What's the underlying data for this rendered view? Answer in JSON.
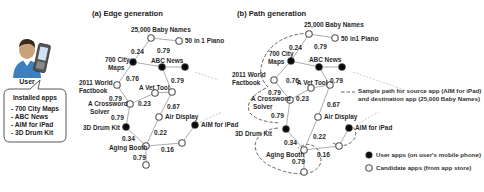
{
  "user": {
    "label": "User",
    "installed_title": "Installed apps",
    "installed_apps": [
      "- 700 City Maps",
      "- ABC News",
      "- AIM for iPad",
      "- 3D Drum Kit"
    ]
  },
  "panel_a": {
    "title": "(a) Edge generation"
  },
  "panel_b": {
    "title": "(b) Path generation"
  },
  "nodes": {
    "baby": "25,000 Baby Names",
    "piano_a": "50 in 1 Piano",
    "piano_b": "50 in1 Piano",
    "citymaps_1": "700 City",
    "citymaps_2": "Maps",
    "abc": "ABC News",
    "factbook_1": "2011 World",
    "factbook_2": "Factbook",
    "vet": "A Vet Tool",
    "crossword_1": "A Crossword",
    "crossword_2": "Solver",
    "air": "Air Display",
    "aim": "AIM for iPad",
    "drum": "3D Drum Kit",
    "aging": "Aging Booth"
  },
  "weights": {
    "city_baby": "0.24",
    "baby_piano": "0.79",
    "city_factbook": "0.76",
    "abc_right": "0.79",
    "factbook_cross": "0.79",
    "cross_vet": "0.23",
    "right_air": "0.67",
    "cross_drum": "0.79",
    "air_aging": "0.22",
    "drum_aging": "0.34",
    "aging_right": "0.16",
    "aging_bottom": "0.79"
  },
  "legend": {
    "path_line1": "Sample path for source app (AIM for iPad)",
    "path_line2": "and destination app (25,000 Baby Names)",
    "user_apps": "User apps (on user's mobile phone)",
    "candidate_apps": "Candidate apps (from app store)"
  },
  "colors": {
    "user_node": "#111111",
    "candidate_node": "#ffffff",
    "edge": "#777777",
    "path": "#666666"
  }
}
